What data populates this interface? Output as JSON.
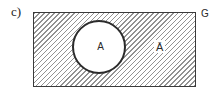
{
  "figure": {
    "subfigure_label": "c)",
    "universe_label": "G",
    "set_label": "A",
    "complement_label": "Ā"
  },
  "style": {
    "hatch_line_color": "#929292",
    "rect_border_color": "#3a3a3a",
    "circle_border_color": "#2b2b2b",
    "region_fill": "#ffffff",
    "hatch_direction": "forward-slash",
    "hatch_spacing_px": 3.5
  }
}
